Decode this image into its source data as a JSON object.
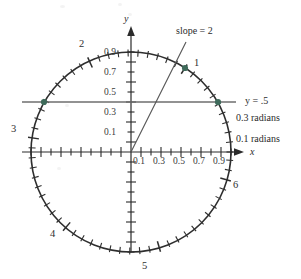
{
  "figure": {
    "kind": "unit-circle-radian-diagram",
    "axis_labels": {
      "x": "x",
      "y": "y"
    },
    "annotations": {
      "slope_line": "slope = 2",
      "horizontal_line": "y = .5",
      "radian_03": "0.3 radians",
      "radian_01": "0.1 radians"
    },
    "radian_marks": [
      "1",
      "2",
      "3",
      "4",
      "5",
      "6"
    ]
  },
  "chart_data": {
    "type": "scatter",
    "title": "",
    "xlabel": "x",
    "ylabel": "y",
    "xlim": [
      -1.15,
      1.15
    ],
    "ylim": [
      -1.15,
      1.15
    ],
    "grid": false,
    "legend": "none",
    "x_tick_labels": [
      "0.1",
      "0.3",
      "0.5",
      "0.7",
      "0.9"
    ],
    "x_tick_values": [
      0.1,
      0.3,
      0.5,
      0.7,
      0.9
    ],
    "y_tick_labels": [
      "0.9",
      "0.7",
      "0.5",
      "0.3",
      "0.1"
    ],
    "y_tick_values": [
      0.9,
      0.7,
      0.5,
      0.3,
      0.1
    ],
    "series": [
      {
        "name": "unit circle",
        "type": "circle",
        "center": [
          0,
          0
        ],
        "radius": 1
      },
      {
        "name": "radian tick marks",
        "type": "ticks",
        "spacing_radians": 0.1,
        "count": 63,
        "labeled_at_radians": [
          1,
          2,
          3,
          4,
          5,
          6
        ],
        "labels": [
          "1",
          "2",
          "3",
          "4",
          "5",
          "6"
        ]
      },
      {
        "name": "slope = 2 line",
        "type": "line",
        "slope": 2,
        "through": [
          0,
          0
        ],
        "x": [
          0,
          0.4472
        ],
        "values": [
          0,
          0.8944
        ]
      },
      {
        "name": "y = .5 line",
        "type": "line",
        "slope": 0,
        "intercept": 0.5,
        "x": [
          -1.15,
          1.15
        ],
        "values": [
          0.5,
          0.5
        ]
      },
      {
        "name": "marked points",
        "type": "scatter",
        "x": [
          0.5403,
          0.866,
          -0.866
        ],
        "values": [
          0.8415,
          0.5,
          0.5
        ],
        "point_labels": [
          "1 radian",
          "y=.5 right",
          "y=.5 left"
        ]
      }
    ],
    "colors": {
      "circle": "#2e2e2e",
      "axes": "#2b2b2b",
      "slope_line": "#555555",
      "h_line": "#6e6e6e",
      "points": "#3f6b5b",
      "text": "#2b2b2b"
    }
  }
}
